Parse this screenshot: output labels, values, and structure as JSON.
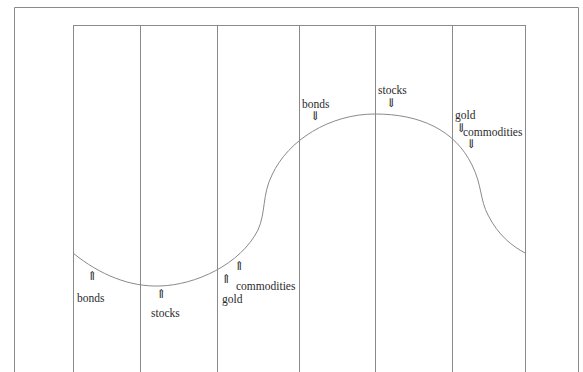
{
  "diagram": {
    "title": "",
    "frame": {
      "x": 14,
      "y": 7,
      "right": 578,
      "bottom": 372
    },
    "inner_top": 25,
    "phase_lines_x": [
      73,
      140,
      217,
      299,
      375,
      452,
      525
    ],
    "curve_color": "#8a8a8a",
    "line_color": "#8a8a8a",
    "trough_labels": [
      {
        "text": "bonds",
        "arrow": "⇑",
        "arrow_x": 87,
        "arrow_y": 268,
        "text_x": 77,
        "text_y": 291
      },
      {
        "text": "stocks",
        "arrow": "⇑",
        "arrow_x": 156,
        "arrow_y": 288,
        "text_x": 150,
        "text_y": 307
      },
      {
        "text": "gold",
        "arrow": "⇑",
        "arrow_x": 220,
        "arrow_y": 273,
        "text_x": 222,
        "text_y": 293
      },
      {
        "text": "commodities",
        "arrow": "⇑",
        "arrow_x": 235,
        "arrow_y": 260,
        "text_x": 235,
        "text_y": 280
      }
    ],
    "peak_labels": [
      {
        "text": "bonds",
        "arrow": "⇓",
        "arrow_x": 310,
        "arrow_y": 110,
        "text_x": 302,
        "text_y": 98
      },
      {
        "text": "stocks",
        "arrow": "⇓",
        "arrow_x": 385,
        "arrow_y": 97,
        "text_x": 378,
        "text_y": 85
      },
      {
        "text": "gold",
        "arrow": "⇓",
        "arrow_x": 456,
        "arrow_y": 123,
        "text_x": 455,
        "text_y": 111
      },
      {
        "text": "commodities",
        "arrow": "⇓",
        "arrow_x": 466,
        "arrow_y": 138,
        "text_x": 463,
        "text_y": 126
      }
    ]
  }
}
